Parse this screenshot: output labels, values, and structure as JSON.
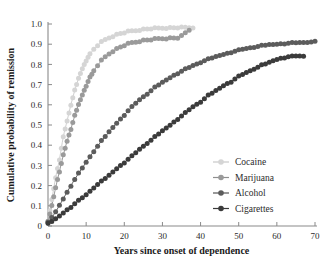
{
  "chart_data": {
    "type": "scatter",
    "title": "",
    "subtitle": "",
    "xlabel": "Years since onset of dependence",
    "ylabel": "Cumulative probability of remission",
    "xlim": [
      0,
      70
    ],
    "ylim": [
      0,
      1.0
    ],
    "xticks": [
      0,
      10,
      20,
      30,
      40,
      50,
      60,
      70
    ],
    "xtick_labels": [
      "0",
      "10",
      "20",
      "30",
      "40",
      "50",
      "60",
      "70"
    ],
    "yticks": [
      0,
      0.1,
      0.2,
      0.3,
      0.4,
      0.5,
      0.6,
      0.7,
      0.8,
      0.9,
      1.0
    ],
    "ytick_labels": [
      "0",
      "0.1",
      "0.2",
      "0.3",
      "0.4",
      "0.5",
      "0.6",
      "0.7",
      "0.8",
      "0.9",
      "1.0"
    ],
    "grid": false,
    "legend_position": "right-middle",
    "series": [
      {
        "name": "Cocaine",
        "color": "#d5d5d5",
        "line_color": "#c9c9c9",
        "marker": "circle",
        "x": [
          0,
          1,
          2,
          3,
          4,
          5,
          6,
          7,
          8,
          9,
          10,
          11,
          12,
          13,
          14,
          15,
          16,
          17,
          18,
          19,
          20,
          21,
          22,
          23,
          24,
          25,
          26,
          27,
          28,
          29,
          30,
          31,
          32,
          33,
          34,
          35,
          36,
          37,
          38
        ],
        "y": [
          0.02,
          0.13,
          0.24,
          0.33,
          0.44,
          0.52,
          0.6,
          0.67,
          0.73,
          0.78,
          0.82,
          0.85,
          0.875,
          0.895,
          0.91,
          0.922,
          0.932,
          0.94,
          0.947,
          0.953,
          0.958,
          0.962,
          0.965,
          0.968,
          0.971,
          0.973,
          0.975,
          0.977,
          0.978,
          0.979,
          0.98,
          0.981,
          0.981,
          0.982,
          0.982,
          0.982,
          0.983,
          0.983,
          0.983
        ]
      },
      {
        "name": "Marijuana",
        "color": "#9a9a9a",
        "line_color": "#8f8f8f",
        "marker": "circle",
        "x": [
          0,
          1,
          2,
          3,
          4,
          5,
          6,
          7,
          8,
          9,
          10,
          11,
          12,
          13,
          14,
          15,
          16,
          17,
          18,
          19,
          20,
          21,
          22,
          23,
          24,
          25,
          26,
          27,
          28,
          29,
          30,
          31,
          32,
          33,
          34,
          35,
          36,
          37
        ],
        "y": [
          0.02,
          0.1,
          0.19,
          0.27,
          0.35,
          0.42,
          0.48,
          0.545,
          0.6,
          0.65,
          0.695,
          0.735,
          0.768,
          0.795,
          0.818,
          0.837,
          0.853,
          0.866,
          0.877,
          0.886,
          0.894,
          0.901,
          0.907,
          0.911,
          0.915,
          0.918,
          0.921,
          0.923,
          0.925,
          0.927,
          0.928,
          0.929,
          0.93,
          0.931,
          0.932,
          0.94,
          0.955,
          0.97
        ]
      },
      {
        "name": "Alcohol",
        "color": "#5c5c5c",
        "line_color": "#555555",
        "marker": "circle",
        "x": [
          0,
          2,
          4,
          6,
          8,
          10,
          12,
          14,
          16,
          18,
          20,
          22,
          24,
          26,
          28,
          30,
          32,
          34,
          36,
          38,
          40,
          42,
          44,
          46,
          48,
          50,
          52,
          54,
          56,
          58,
          60,
          62,
          64,
          66,
          68,
          70
        ],
        "y": [
          0.015,
          0.07,
          0.135,
          0.2,
          0.26,
          0.315,
          0.37,
          0.42,
          0.465,
          0.51,
          0.55,
          0.59,
          0.625,
          0.655,
          0.685,
          0.71,
          0.735,
          0.757,
          0.776,
          0.794,
          0.81,
          0.825,
          0.838,
          0.85,
          0.861,
          0.87,
          0.879,
          0.886,
          0.892,
          0.897,
          0.901,
          0.904,
          0.906,
          0.908,
          0.91,
          0.911
        ]
      },
      {
        "name": "Cigarettes",
        "color": "#3b3b3b",
        "line_color": "#3a3a3a",
        "marker": "circle",
        "x": [
          0,
          2,
          4,
          6,
          8,
          10,
          12,
          14,
          16,
          18,
          20,
          22,
          24,
          26,
          28,
          30,
          32,
          34,
          36,
          38,
          40,
          42,
          44,
          46,
          48,
          50,
          52,
          54,
          56,
          58,
          60,
          62,
          64,
          66,
          67
        ],
        "y": [
          0.01,
          0.035,
          0.065,
          0.095,
          0.125,
          0.155,
          0.19,
          0.22,
          0.25,
          0.285,
          0.315,
          0.345,
          0.38,
          0.41,
          0.44,
          0.47,
          0.5,
          0.53,
          0.56,
          0.59,
          0.615,
          0.645,
          0.67,
          0.695,
          0.715,
          0.74,
          0.76,
          0.778,
          0.795,
          0.81,
          0.825,
          0.835,
          0.84,
          0.842,
          0.842
        ]
      }
    ]
  },
  "legend": {
    "entries": [
      {
        "label": "Cocaine"
      },
      {
        "label": "Marijuana"
      },
      {
        "label": "Alcohol"
      },
      {
        "label": "Cigarettes"
      }
    ]
  }
}
